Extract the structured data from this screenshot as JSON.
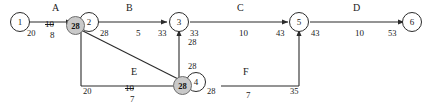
{
  "diagram": {
    "type": "network-diagram",
    "nodes": [
      {
        "id": "n1",
        "label": "1"
      },
      {
        "id": "n2",
        "label": "2"
      },
      {
        "id": "n3",
        "label": "3"
      },
      {
        "id": "n4",
        "label": "4"
      },
      {
        "id": "n5",
        "label": "5"
      },
      {
        "id": "n6",
        "label": "6"
      }
    ],
    "activities": [
      {
        "id": "A",
        "name": "A",
        "duration": "8",
        "crossed_duration": "10",
        "from": "1",
        "to": "2"
      },
      {
        "id": "B",
        "name": "B",
        "duration": "5",
        "from": "2",
        "to": "3"
      },
      {
        "id": "C",
        "name": "C",
        "duration": "10",
        "from": "3",
        "to": "5"
      },
      {
        "id": "D",
        "name": "D",
        "duration": "10",
        "from": "5",
        "to": "6"
      },
      {
        "id": "E",
        "name": "E",
        "duration": "7",
        "crossed_duration": "10",
        "from": "2",
        "to": "4"
      },
      {
        "id": "F",
        "name": "F",
        "duration": "7",
        "from": "4",
        "to": "5"
      }
    ],
    "event_times": {
      "n1_right": "20",
      "n2_marker": "28",
      "n2_right": "28",
      "n3_left": "33",
      "n3_right": "33",
      "n3_below": "28",
      "n4_marker": "28",
      "n4_right": "28",
      "n4_above": "28",
      "n5_left": "43",
      "n5_right": "43",
      "n6_left": "53",
      "e_start": "20",
      "f_end": "35"
    },
    "colors": {
      "line": "#2b2b2b",
      "marker_fill": "#c9c9c9",
      "marker_stroke": "#6e6e6e",
      "text": "#1a1a1a",
      "background": "#ffffff"
    }
  }
}
